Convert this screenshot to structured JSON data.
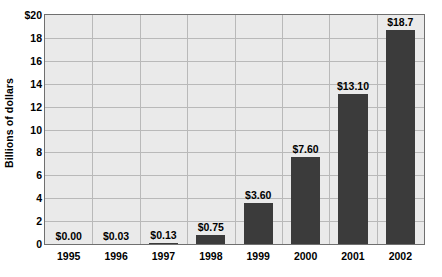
{
  "chart_data": {
    "type": "bar",
    "title": "",
    "subtitle": "",
    "xlabel": "",
    "ylabel": "Billions of dollars",
    "categories": [
      "1995",
      "1996",
      "1997",
      "1998",
      "1999",
      "2000",
      "2001",
      "2002"
    ],
    "values": [
      0.0,
      0.03,
      0.13,
      0.75,
      3.6,
      7.6,
      13.1,
      18.7
    ],
    "data_labels": [
      "$0.00",
      "$0.03",
      "$0.13",
      "$0.75",
      "$3.60",
      "$7.60",
      "$13.10",
      "$18.7"
    ],
    "ylim": [
      0,
      20
    ],
    "ytick_values": [
      20,
      18,
      16,
      14,
      12,
      10,
      8,
      6,
      4,
      2,
      0
    ],
    "ytick_labels": [
      "$20",
      "18",
      "16",
      "14",
      "12",
      "10",
      "8",
      "6",
      "4",
      "2",
      "0"
    ],
    "grid": "both",
    "legend": "none",
    "series_color": "#3b3b3b",
    "plot_background": "#eaeaea",
    "gridline_color": "#b9b9b9",
    "frame_color": "#6f6f6f",
    "page_background": "#ffffff"
  }
}
